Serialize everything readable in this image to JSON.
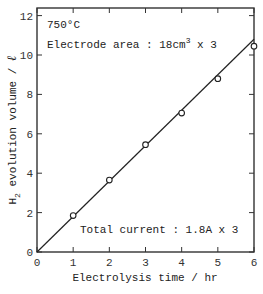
{
  "chart_data": {
    "type": "scatter",
    "title": "",
    "xlabel": "Electrolysis time / hr",
    "ylabel": "H2 evolution volume / L",
    "ylabel_parts": {
      "prefix": "H",
      "subscript": "2",
      "suffix": " evolution volume / ",
      "unit": "ℓ"
    },
    "xlim": [
      0,
      6
    ],
    "ylim": [
      0,
      12.5
    ],
    "xticks": [
      0,
      1,
      2,
      3,
      4,
      5,
      6
    ],
    "yticks": [
      0,
      2,
      4,
      6,
      8,
      10,
      12
    ],
    "grid": false,
    "series": [
      {
        "name": "measured",
        "marker": "open-circle",
        "x": [
          1,
          2,
          3,
          4,
          5,
          6
        ],
        "y": [
          1.85,
          3.65,
          5.45,
          7.05,
          8.8,
          10.45
        ]
      },
      {
        "name": "fit line",
        "style": "solid-line",
        "x": [
          0,
          6
        ],
        "y": [
          0,
          10.8
        ]
      }
    ],
    "annotations": [
      {
        "text": "750°C"
      },
      {
        "text": "Electrode area : 18cm",
        "superscript": "3",
        "suffix": " x 3"
      },
      {
        "text": "Total current : 1.8A x 3"
      }
    ]
  }
}
